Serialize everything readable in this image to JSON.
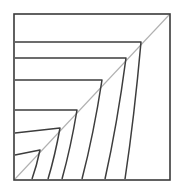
{
  "figure": {
    "title": "Nested corner band line drawing",
    "background_color": "#ffffff",
    "line_color": "#3a3a3a",
    "diagonal_color": "#b0b0b0",
    "canvas": {
      "width": 181,
      "height": 192
    },
    "frame": {
      "label": "outer-square-frame",
      "x1": 14,
      "y1": 14,
      "x2": 170,
      "y2": 180,
      "stroke_width": 1.6
    },
    "diagonal": {
      "label": "corner-fold-diagonal",
      "from_x": 15,
      "from_y": 179,
      "to_x": 169,
      "to_y": 15,
      "stroke_width": 1.1
    },
    "bands": [
      {
        "name": "band-1",
        "left_x": 15,
        "top_y": 42,
        "turn_x": 141,
        "turn_y": 42,
        "bottom_x": 125,
        "bottom_y": 179
      },
      {
        "name": "band-2",
        "left_x": 15,
        "top_y": 58,
        "turn_x": 126,
        "turn_y": 58,
        "bottom_x": 105,
        "bottom_y": 179
      },
      {
        "name": "band-3",
        "left_x": 15,
        "top_y": 80,
        "turn_x": 102,
        "turn_y": 80,
        "bottom_x": 82,
        "bottom_y": 179
      },
      {
        "name": "band-4",
        "left_x": 15,
        "top_y": 110,
        "turn_x": 77,
        "turn_y": 110,
        "bottom_x": 62,
        "bottom_y": 179
      },
      {
        "name": "band-5",
        "left_x": 15,
        "top_y": 133,
        "turn_x": 60,
        "turn_y": 128,
        "bottom_x": 48,
        "bottom_y": 179
      },
      {
        "name": "band-6",
        "left_x": 15,
        "top_y": 155,
        "turn_x": 40,
        "turn_y": 150,
        "bottom_x": 32,
        "bottom_y": 179
      }
    ],
    "band_count": 6
  }
}
